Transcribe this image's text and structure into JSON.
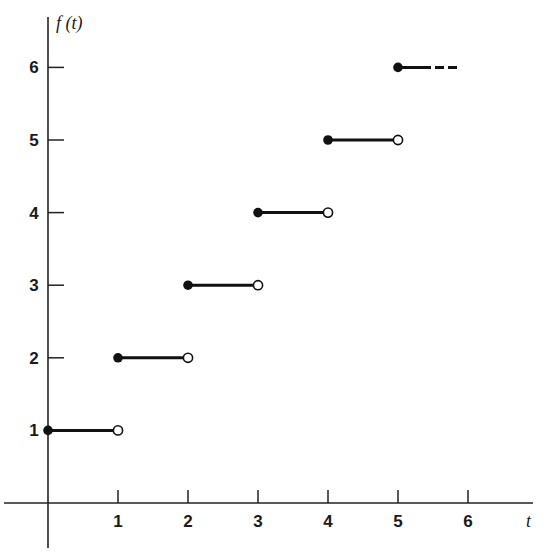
{
  "chart_data": {
    "type": "line",
    "subtype": "step-function",
    "title": "",
    "xlabel": "t",
    "ylabel": "f (t)",
    "x_ticks": [
      1,
      2,
      3,
      4,
      5,
      6
    ],
    "y_ticks": [
      1,
      2,
      3,
      4,
      5,
      6
    ],
    "xlim": [
      0,
      6.5
    ],
    "ylim": [
      0,
      6.5
    ],
    "grid": false,
    "legend": null,
    "series": [
      {
        "name": "f(t)",
        "segments": [
          {
            "x_start": 0,
            "x_end": 1,
            "y": 1,
            "start_closed": true,
            "end_closed": false
          },
          {
            "x_start": 1,
            "x_end": 2,
            "y": 2,
            "start_closed": true,
            "end_closed": false
          },
          {
            "x_start": 2,
            "x_end": 3,
            "y": 3,
            "start_closed": true,
            "end_closed": false
          },
          {
            "x_start": 3,
            "x_end": 4,
            "y": 4,
            "start_closed": true,
            "end_closed": false
          },
          {
            "x_start": 4,
            "x_end": 5,
            "y": 5,
            "start_closed": true,
            "end_closed": false
          },
          {
            "x_start": 5,
            "x_end": 5.85,
            "y": 6,
            "start_closed": true,
            "end_closed": null,
            "continues": "dashed"
          }
        ]
      }
    ],
    "colors": {
      "line": "#111111",
      "axis": "#222222",
      "background": "#ffffff"
    }
  }
}
